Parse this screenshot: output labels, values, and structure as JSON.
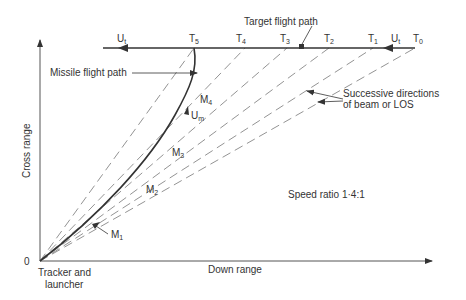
{
  "diagram": {
    "axes": {
      "y_label": "Cross range",
      "x_label": "Down range",
      "origin_label": "0",
      "origin_caption_line1": "Tracker and",
      "origin_caption_line2": "launcher"
    },
    "labels": {
      "target_flight_path": "Target flight path",
      "missile_flight_path": "Missile flight path",
      "beam_line1": "Successive directions",
      "beam_line2": "of beam or LOS",
      "speed_ratio": "Speed ratio 1·4:1"
    },
    "target_points": [
      {
        "name": "T",
        "sub": "0"
      },
      {
        "name": "T",
        "sub": "1"
      },
      {
        "name": "T",
        "sub": "2"
      },
      {
        "name": "T",
        "sub": "3"
      },
      {
        "name": "T",
        "sub": "4"
      },
      {
        "name": "T",
        "sub": "5"
      }
    ],
    "target_velocity": {
      "name": "U",
      "sub": "t"
    },
    "missile_points": [
      {
        "name": "M",
        "sub": "1"
      },
      {
        "name": "M",
        "sub": "2"
      },
      {
        "name": "M",
        "sub": "3"
      },
      {
        "name": "M",
        "sub": "4"
      }
    ],
    "missile_velocity": {
      "name": "U",
      "sub": "m"
    },
    "colors": {
      "line": "#333333",
      "dashed": "#777777"
    }
  }
}
